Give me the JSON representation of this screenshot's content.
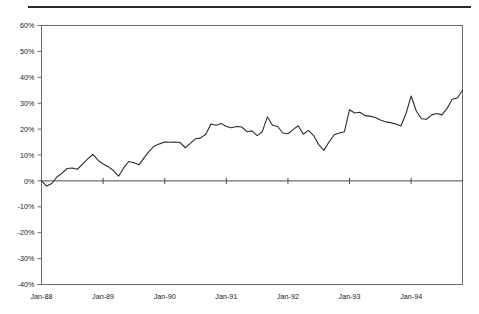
{
  "figure": {
    "has_top_rule": true,
    "background_color": "#ffffff",
    "line_color": "#2b2b2b",
    "axis_color": "#5a5a5a"
  },
  "chart_data": {
    "type": "line",
    "title": "",
    "subtitle": "",
    "xlabel": "",
    "ylabel": "",
    "grid": false,
    "legend": "none",
    "ylim": [
      -40,
      60
    ],
    "ytick_labels": [
      "60%",
      "50%",
      "40%",
      "30%",
      "20%",
      "10%",
      "0%",
      "-10%",
      "-20%",
      "-30%",
      "-40%"
    ],
    "ytick_values": [
      60,
      50,
      40,
      30,
      20,
      10,
      0,
      -10,
      -20,
      -30,
      -40
    ],
    "xtick_labels": [
      "Jan-88",
      "Jan-89",
      "Jan-90",
      "Jan-91",
      "Jan-92",
      "Jan-93",
      "Jan-94"
    ],
    "xtick_values": [
      0,
      12,
      24,
      36,
      48,
      60,
      72
    ],
    "xlim": [
      0,
      82
    ],
    "series": [
      {
        "name": "cumulative return",
        "x": [
          0,
          1,
          2,
          3,
          4,
          5,
          6,
          7,
          8,
          9,
          10,
          11,
          12,
          13,
          14,
          15,
          16,
          17,
          18,
          19,
          20,
          21,
          22,
          23,
          24,
          25,
          26,
          27,
          28,
          29,
          30,
          31,
          32,
          33,
          34,
          35,
          36,
          37,
          38,
          39,
          40,
          41,
          42,
          43,
          44,
          45,
          46,
          47,
          48,
          49,
          50,
          51,
          52,
          53,
          54,
          55,
          56,
          57,
          58,
          59,
          60,
          61,
          62,
          63,
          64,
          65,
          66,
          67,
          68,
          69,
          70,
          71,
          72,
          73,
          74,
          75,
          76,
          77,
          78,
          79,
          80,
          81,
          82
        ],
        "values": [
          0.0,
          -2.0,
          -1.0,
          1.5,
          3.0,
          4.8,
          5.0,
          4.5,
          6.5,
          8.5,
          10.2,
          8.0,
          6.5,
          5.5,
          4.0,
          1.8,
          5.0,
          7.5,
          7.0,
          6.2,
          9.0,
          11.5,
          13.5,
          14.3,
          15.0,
          14.9,
          15.0,
          14.8,
          12.8,
          14.5,
          16.3,
          16.6,
          18.0,
          22.0,
          21.5,
          22.2,
          21.0,
          20.5,
          21.0,
          20.8,
          19.0,
          19.3,
          17.5,
          19.0,
          24.7,
          21.5,
          21.0,
          18.5,
          18.2,
          19.8,
          21.3,
          18.0,
          19.5,
          17.5,
          14.0,
          11.8,
          15.0,
          17.8,
          18.5,
          19.0,
          27.5,
          26.2,
          26.5,
          25.2,
          25.0,
          24.5,
          23.5,
          22.8,
          22.5,
          22.0,
          21.2,
          26.0,
          32.8,
          27.0,
          24.0,
          23.8,
          25.5,
          26.0,
          25.5,
          28.0,
          31.5,
          32.0,
          35.0
        ]
      }
    ]
  }
}
